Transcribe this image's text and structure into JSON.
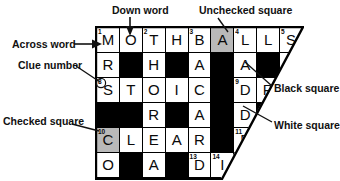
{
  "diagram": {
    "labels": [
      {
        "key": "down_word",
        "text": "Down word"
      },
      {
        "key": "unchecked_square",
        "text": "Unchecked square"
      },
      {
        "key": "across_word",
        "text": "Across word"
      },
      {
        "key": "clue_number",
        "text": "Clue number"
      },
      {
        "key": "checked_square",
        "text": "Checked square"
      },
      {
        "key": "black_square",
        "text": "Black square"
      },
      {
        "key": "white_square",
        "text": "White square"
      }
    ],
    "colors": {
      "white_square": "#ffffff",
      "black_square": "#000000",
      "shaded_square": "#b9b9b9",
      "text": "#0a0a0a",
      "border": "#000000"
    }
  },
  "grid": {
    "columns": 9,
    "rows": 7,
    "cells": [
      [
        {
          "letter": "M",
          "num": "1",
          "state": "white"
        },
        {
          "letter": "O",
          "num": "",
          "state": "white"
        },
        {
          "letter": "T",
          "num": "2",
          "state": "white"
        },
        {
          "letter": "H",
          "num": "",
          "state": "white"
        },
        {
          "letter": "B",
          "num": "3",
          "state": "white"
        },
        {
          "letter": "A",
          "num": "",
          "state": "shaded"
        },
        {
          "letter": "L",
          "num": "4",
          "state": "white"
        },
        {
          "letter": "L",
          "num": "",
          "state": "white"
        },
        {
          "letter": "S",
          "num": "5",
          "state": "white"
        }
      ],
      [
        {
          "letter": "R",
          "num": "",
          "state": "white"
        },
        {
          "letter": "",
          "num": "",
          "state": "black"
        },
        {
          "letter": "H",
          "num": "",
          "state": "white"
        },
        {
          "letter": "",
          "num": "",
          "state": "black"
        },
        {
          "letter": "A",
          "num": "",
          "state": "white"
        },
        {
          "letter": "",
          "num": "",
          "state": "black"
        },
        {
          "letter": "A",
          "num": "",
          "state": "white"
        },
        {
          "letter": "",
          "num": "",
          "state": "black"
        },
        {
          "letter": "",
          "num": "",
          "state": "white"
        }
      ],
      [
        {
          "letter": "S",
          "num": "8",
          "state": "white"
        },
        {
          "letter": "T",
          "num": "",
          "state": "white"
        },
        {
          "letter": "O",
          "num": "",
          "state": "white"
        },
        {
          "letter": "I",
          "num": "",
          "state": "white"
        },
        {
          "letter": "C",
          "num": "",
          "state": "white"
        },
        {
          "letter": "",
          "num": "",
          "state": "black"
        },
        {
          "letter": "D",
          "num": "9",
          "state": "white"
        },
        {
          "letter": "R",
          "num": "",
          "state": "white"
        },
        {
          "letter": "",
          "num": "",
          "state": "white"
        }
      ],
      [
        {
          "letter": "",
          "num": "",
          "state": "black"
        },
        {
          "letter": "",
          "num": "",
          "state": "black"
        },
        {
          "letter": "R",
          "num": "",
          "state": "white"
        },
        {
          "letter": "",
          "num": "",
          "state": "black"
        },
        {
          "letter": "A",
          "num": "",
          "state": "white"
        },
        {
          "letter": "",
          "num": "",
          "state": "black"
        },
        {
          "letter": "D",
          "num": "",
          "state": "white"
        },
        {
          "letter": "",
          "num": "",
          "state": "black"
        },
        {
          "letter": "",
          "num": "",
          "state": "white"
        }
      ],
      [
        {
          "letter": "C",
          "num": "10",
          "state": "shaded"
        },
        {
          "letter": "L",
          "num": "",
          "state": "white"
        },
        {
          "letter": "E",
          "num": "",
          "state": "white"
        },
        {
          "letter": "A",
          "num": "",
          "state": "white"
        },
        {
          "letter": "R",
          "num": "",
          "state": "white"
        },
        {
          "letter": "",
          "num": "",
          "state": "black"
        },
        {
          "letter": "E",
          "num": "11",
          "state": "white"
        },
        {
          "letter": "",
          "num": "",
          "state": "white"
        },
        {
          "letter": "",
          "num": "",
          "state": "white"
        }
      ],
      [
        {
          "letter": "O",
          "num": "",
          "state": "white"
        },
        {
          "letter": "",
          "num": "",
          "state": "black"
        },
        {
          "letter": "A",
          "num": "",
          "state": "white"
        },
        {
          "letter": "",
          "num": "",
          "state": "black"
        },
        {
          "letter": "D",
          "num": "13",
          "state": "white"
        },
        {
          "letter": "I",
          "num": "14",
          "state": "white"
        },
        {
          "letter": "",
          "num": "",
          "state": "white"
        },
        {
          "letter": "",
          "num": "",
          "state": "white"
        },
        {
          "letter": "",
          "num": "",
          "state": "white"
        }
      ],
      [
        {
          "letter": "",
          "num": "15",
          "state": "white"
        },
        {
          "letter": "",
          "num": "",
          "state": "white"
        },
        {
          "letter": "",
          "num": "",
          "state": "white"
        },
        {
          "letter": "",
          "num": "",
          "state": "white"
        },
        {
          "letter": "",
          "num": "",
          "state": "white"
        },
        {
          "letter": "",
          "num": "",
          "state": "white"
        },
        {
          "letter": "",
          "num": "",
          "state": "white"
        },
        {
          "letter": "",
          "num": "",
          "state": "white"
        },
        {
          "letter": "",
          "num": "",
          "state": "white"
        }
      ]
    ]
  }
}
